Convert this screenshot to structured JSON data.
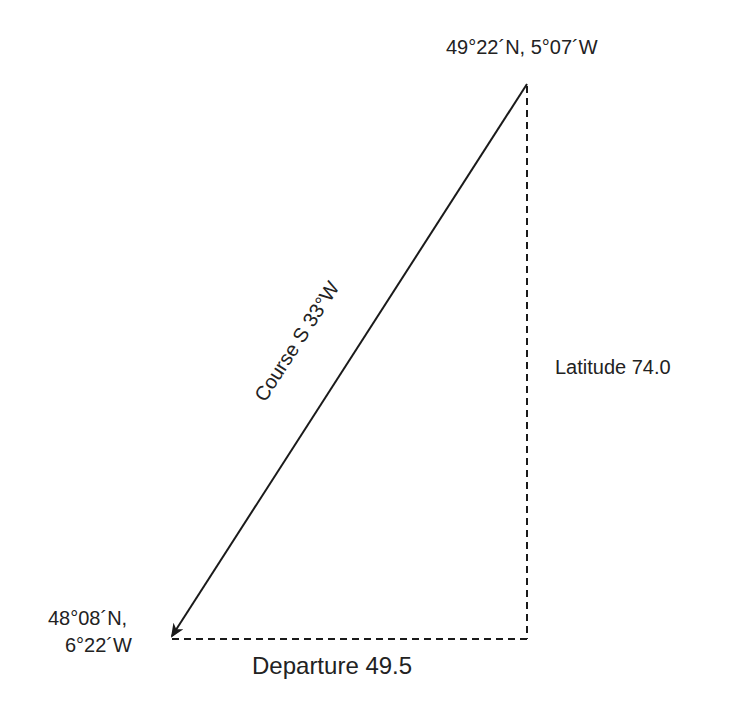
{
  "diagram": {
    "type": "navigation-triangle",
    "start_point": {
      "label": "49°22´N, 5°07´W"
    },
    "end_point": {
      "label_line1": "48°08´N,",
      "label_line2": "6°22´W"
    },
    "course_label": "Course S 33°W",
    "latitude_label": "Latitude 74.0",
    "departure_label": "Departure 49.5",
    "colors": {
      "line": "#1a1a1a",
      "text": "#222222"
    }
  }
}
